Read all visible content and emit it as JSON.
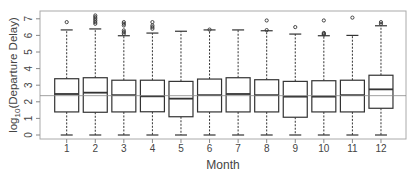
{
  "chart_data": {
    "type": "boxplot",
    "title": "",
    "xlabel": "Month",
    "ylabel": "log10(Departure Delay)",
    "ylabel_parts": {
      "base": "log",
      "sub": "10",
      "rest": "(Departure Delay)"
    },
    "ylim": [
      0,
      7
    ],
    "yticks": [
      0,
      1,
      2,
      3,
      4,
      5,
      6,
      7
    ],
    "categories": [
      "1",
      "2",
      "3",
      "4",
      "5",
      "6",
      "7",
      "8",
      "9",
      "10",
      "11",
      "12"
    ],
    "reference_line": 2.37,
    "grid": false,
    "boxes": [
      {
        "month": "1",
        "min": 0,
        "q1": 1.39,
        "median": 2.47,
        "q3": 3.39,
        "max": 6.33,
        "outliers": [
          6.8
        ]
      },
      {
        "month": "2",
        "min": 0,
        "q1": 1.37,
        "median": 2.55,
        "q3": 3.45,
        "max": 6.39,
        "outliers": [
          6.7,
          6.8,
          6.9,
          7.0,
          7.1,
          7.2
        ]
      },
      {
        "month": "3",
        "min": 0,
        "q1": 1.39,
        "median": 2.4,
        "q3": 3.3,
        "max": 5.98,
        "outliers": [
          6.1,
          6.2,
          6.3,
          6.6,
          6.7,
          6.8
        ]
      },
      {
        "month": "4",
        "min": 0,
        "q1": 1.4,
        "median": 2.33,
        "q3": 3.3,
        "max": 6.14,
        "outliers": [
          6.4,
          6.5,
          6.6,
          6.8
        ]
      },
      {
        "month": "5",
        "min": 0,
        "q1": 1.1,
        "median": 2.19,
        "q3": 3.23,
        "max": 6.25,
        "outliers": []
      },
      {
        "month": "6",
        "min": 0,
        "q1": 1.39,
        "median": 2.4,
        "q3": 3.37,
        "max": 6.33,
        "outliers": [
          6.35
        ]
      },
      {
        "month": "7",
        "min": 0,
        "q1": 1.39,
        "median": 2.47,
        "q3": 3.45,
        "max": 6.33,
        "outliers": []
      },
      {
        "month": "8",
        "min": 0,
        "q1": 1.39,
        "median": 2.4,
        "q3": 3.33,
        "max": 6.28,
        "outliers": [
          6.32,
          6.9
        ]
      },
      {
        "month": "9",
        "min": 0,
        "q1": 1.07,
        "median": 2.31,
        "q3": 3.23,
        "max": 6.08,
        "outliers": [
          6.5
        ]
      },
      {
        "month": "10",
        "min": 0,
        "q1": 1.39,
        "median": 2.31,
        "q3": 3.27,
        "max": 5.98,
        "outliers": [
          6.05,
          6.1,
          6.15,
          6.9
        ]
      },
      {
        "month": "11",
        "min": 0,
        "q1": 1.39,
        "median": 2.4,
        "q3": 3.3,
        "max": 6.0,
        "outliers": [
          7.07
        ]
      },
      {
        "month": "12",
        "min": 0,
        "q1": 1.61,
        "median": 2.75,
        "q3": 3.6,
        "max": 6.58,
        "outliers": [
          6.7,
          6.8
        ]
      }
    ],
    "colors": {
      "box": "#333333",
      "axis": "#888888",
      "frame": "#aaaaaa",
      "refline": "#888888",
      "text": "#444444"
    }
  }
}
